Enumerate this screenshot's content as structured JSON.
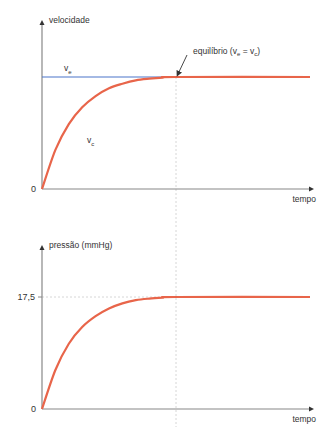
{
  "chart_data": [
    {
      "type": "line",
      "title": "",
      "ylabel": "velocidade",
      "xlabel": "tempo",
      "y_origin_label": "0",
      "grid": false,
      "xlim": [
        0,
        1
      ],
      "ylim": [
        0,
        1.4
      ],
      "series": [
        {
          "name": "v_e",
          "label_main": "v",
          "label_sub": "e",
          "color": "#4a74c9",
          "x": [
            0,
            0.5
          ],
          "y": [
            1,
            1
          ]
        },
        {
          "name": "v_c",
          "label_main": "v",
          "label_sub": "c",
          "color": "#e8654a",
          "x": [
            0,
            0.05,
            0.1,
            0.15,
            0.2,
            0.25,
            0.3,
            0.35,
            0.4,
            0.45,
            0.5,
            1
          ],
          "y": [
            0,
            0.35,
            0.58,
            0.73,
            0.83,
            0.9,
            0.94,
            0.97,
            0.985,
            0.995,
            1,
            1
          ]
        }
      ],
      "annotation": {
        "text_prefix": "equilíbrio (v",
        "sub1": "e",
        "mid": " = v",
        "sub2": "c",
        "suffix": ")",
        "x": 0.5,
        "y": 1
      },
      "equilibrium_x": 0.5
    },
    {
      "type": "line",
      "title": "",
      "ylabel": "pressão (mmHg)",
      "xlabel": "tempo",
      "y_origin_label": "0",
      "grid": false,
      "xlim": [
        0,
        1
      ],
      "ylim": [
        0,
        24
      ],
      "yticks": [
        17.5
      ],
      "ytick_labels": [
        "17,5"
      ],
      "series": [
        {
          "name": "pressão",
          "color": "#e8654a",
          "x": [
            0,
            0.05,
            0.1,
            0.15,
            0.2,
            0.25,
            0.3,
            0.35,
            0.4,
            0.45,
            0.5,
            1
          ],
          "y": [
            0,
            6.1,
            10.2,
            12.8,
            14.5,
            15.7,
            16.5,
            17.0,
            17.25,
            17.4,
            17.5,
            17.5
          ]
        }
      ],
      "reference_line_y": 17.5,
      "equilibrium_x": 0.5
    }
  ]
}
